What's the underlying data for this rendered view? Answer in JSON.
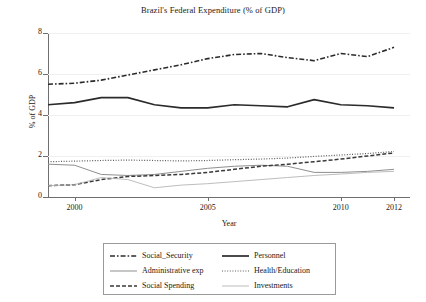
{
  "chart_data": {
    "type": "line",
    "title": "Brazil's Federal Expenditure (% of GDP)",
    "xlabel": "Year",
    "ylabel": "% of GDP",
    "xlim": [
      1999,
      2012.6
    ],
    "ylim": [
      0,
      8
    ],
    "grid": true,
    "x": [
      1999,
      2000,
      2001,
      2002,
      2003,
      2004,
      2005,
      2006,
      2007,
      2008,
      2009,
      2010,
      2011,
      2012
    ],
    "xticks": [
      "2000",
      "2005",
      "2010",
      "2012"
    ],
    "xtick_values": [
      2000,
      2005,
      2010,
      2012
    ],
    "yticks": [
      "0",
      "2",
      "4",
      "6",
      "8"
    ],
    "ytick_values": [
      0,
      2,
      4,
      6,
      8
    ],
    "legend_position": "below-center",
    "series": [
      {
        "name": "Social_Security",
        "style": "dash-dot",
        "color": "#2b2b2b",
        "width": 1.6,
        "values": [
          5.5,
          5.55,
          5.7,
          5.95,
          6.2,
          6.45,
          6.75,
          6.95,
          7.0,
          6.8,
          6.65,
          7.0,
          6.85,
          7.3
        ]
      },
      {
        "name": "Personnel",
        "style": "solid",
        "color": "#2b2b2b",
        "width": 1.7,
        "values": [
          4.5,
          4.6,
          4.85,
          4.85,
          4.5,
          4.35,
          4.35,
          4.5,
          4.45,
          4.4,
          4.75,
          4.5,
          4.45,
          4.35
        ]
      },
      {
        "name": "Administrative exp",
        "style": "solid",
        "color": "#8f8f8f",
        "width": 1.0,
        "values": [
          1.6,
          1.55,
          1.1,
          1.05,
          1.1,
          1.25,
          1.4,
          1.5,
          1.55,
          1.5,
          1.2,
          1.2,
          1.25,
          1.35
        ]
      },
      {
        "name": "Health/Education",
        "style": "dotted",
        "color": "#5a5a5a",
        "width": 1.2,
        "values": [
          1.72,
          1.75,
          1.78,
          1.8,
          1.78,
          1.76,
          1.78,
          1.82,
          1.85,
          1.9,
          1.98,
          2.05,
          2.12,
          2.22
        ]
      },
      {
        "name": "Social Spending",
        "style": "dashed",
        "color": "#3a3a3a",
        "width": 1.5,
        "values": [
          0.55,
          0.6,
          0.85,
          1.0,
          1.05,
          1.1,
          1.2,
          1.35,
          1.5,
          1.6,
          1.72,
          1.85,
          2.0,
          2.15
        ]
      },
      {
        "name": "Investments",
        "style": "solid",
        "color": "#b5b5b5",
        "width": 0.9,
        "values": [
          0.55,
          0.6,
          0.95,
          0.85,
          0.45,
          0.58,
          0.65,
          0.75,
          0.85,
          0.95,
          1.05,
          1.12,
          1.2,
          1.25
        ]
      }
    ]
  },
  "legend": {
    "entries": [
      {
        "label": "Social_Security",
        "swatch": "dash-dot-swatch"
      },
      {
        "label": "Personnel",
        "swatch": "solid-thick-swatch"
      },
      {
        "label": "Administrative exp",
        "swatch": "solid-gray-swatch"
      },
      {
        "label": "Health/Education",
        "swatch": "dotted-swatch"
      },
      {
        "label": "Social Spending",
        "swatch": "dashed-swatch"
      },
      {
        "label": "Investments",
        "swatch": "solid-light-swatch"
      }
    ]
  }
}
